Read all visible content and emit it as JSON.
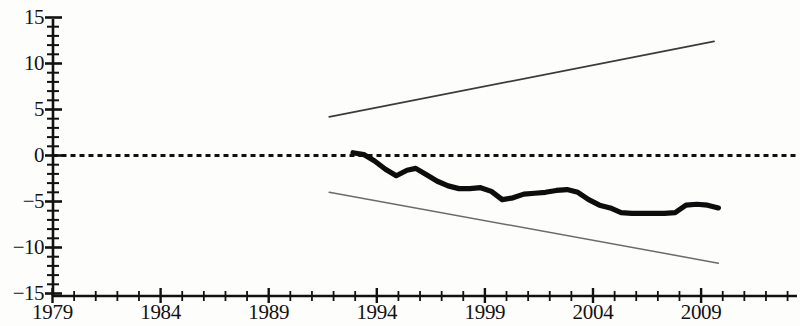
{
  "chart_data": {
    "type": "line",
    "title": "",
    "subtitle": "",
    "xlabel": "",
    "ylabel": "",
    "xlim": [
      1979,
      1981.5
    ],
    "ylim": [
      -15,
      15
    ],
    "grid": false,
    "legend": "none",
    "y_ticks": [
      15,
      10,
      5,
      0,
      -5,
      -10,
      -15
    ],
    "y_tick_labels": [
      "15",
      "10",
      "5",
      "0",
      "−5",
      "−10",
      "−15"
    ],
    "y_minor_tick_step": 1,
    "x_ticks_major": [
      1979,
      1984,
      1989,
      1994,
      1999,
      2004,
      2009
    ],
    "x_tick_labels": [
      "1979",
      "1984",
      "1989",
      "1994",
      "1999",
      "2004",
      "2009"
    ],
    "x_minor_tick_step": 1,
    "x_axis_start": 1979,
    "x_axis_end": 2013.5,
    "series": [
      {
        "name": "zero-reference",
        "style": "dotted",
        "color": "#111111",
        "x": [
          1979,
          2013.5
        ],
        "values": [
          0,
          0
        ]
      },
      {
        "name": "upper-confidence-bound",
        "style": "thin-solid",
        "color": "#3b3b3b",
        "x": [
          1991.8,
          2009.6
        ],
        "values": [
          4.2,
          12.4
        ]
      },
      {
        "name": "lower-confidence-bound",
        "style": "thin-solid",
        "color": "#6b6b6b",
        "x": [
          1991.8,
          2009.8
        ],
        "values": [
          -4.0,
          -11.7
        ]
      },
      {
        "name": "main-estimate",
        "style": "thick-solid",
        "color": "#0d0d0d",
        "x": [
          1992.9,
          1993.4,
          1993.9,
          1994.4,
          1994.9,
          1995.4,
          1995.8,
          1996.3,
          1996.8,
          1997.3,
          1997.8,
          1998.3,
          1998.8,
          1999.3,
          1999.8,
          2000.3,
          2000.8,
          2001.3,
          2001.8,
          2002.3,
          2002.8,
          2003.3,
          2003.8,
          2004.3,
          2004.8,
          2005.3,
          2005.8,
          2006.3,
          2006.8,
          2007.3,
          2007.8,
          2008.3,
          2008.8,
          2009.3,
          2009.8
        ],
        "values": [
          0.3,
          0.1,
          -0.6,
          -1.5,
          -2.2,
          -1.6,
          -1.4,
          -2.1,
          -2.8,
          -3.3,
          -3.6,
          -3.6,
          -3.5,
          -3.9,
          -4.8,
          -4.6,
          -4.2,
          -4.1,
          -4.0,
          -3.8,
          -3.7,
          -4.0,
          -4.8,
          -5.4,
          -5.7,
          -6.2,
          -6.3,
          -6.3,
          -6.3,
          -6.3,
          -6.2,
          -5.4,
          -5.3,
          -5.4,
          -5.7
        ]
      }
    ]
  },
  "axes": {
    "y_labels": [
      "15",
      "10",
      "5",
      "0",
      "−5",
      "−10",
      "−15"
    ],
    "x_labels": [
      "1979",
      "1984",
      "1989",
      "1994",
      "1999",
      "2004",
      "2009"
    ]
  }
}
